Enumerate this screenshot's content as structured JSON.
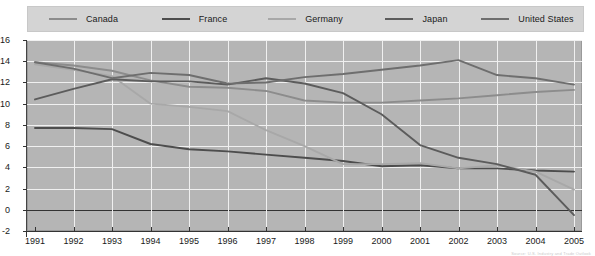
{
  "chart_data": {
    "type": "line",
    "title": "",
    "xlabel": "",
    "ylabel": "",
    "x": [
      1991,
      1992,
      1993,
      1994,
      1995,
      1996,
      1997,
      1998,
      1999,
      2000,
      2001,
      2002,
      2003,
      2004,
      2005
    ],
    "categories": [
      "1991",
      "1992",
      "1993",
      "1994",
      "1995",
      "1996",
      "1997",
      "1998",
      "1999",
      "2000",
      "2001",
      "2002",
      "2003",
      "2004",
      "2005"
    ],
    "xlim": [
      1991,
      2005
    ],
    "ylim": [
      -2,
      16
    ],
    "yticks": [
      -2,
      0,
      2,
      4,
      6,
      8,
      10,
      12,
      14,
      16
    ],
    "grid": true,
    "legend_position": "top",
    "series": [
      {
        "name": "Canada",
        "color": "#8c8c8c",
        "values": [
          13.9,
          13.6,
          13.1,
          12.2,
          11.6,
          11.5,
          11.2,
          10.3,
          10.1,
          10.1,
          10.3,
          10.5,
          10.8,
          11.1,
          11.3
        ]
      },
      {
        "name": "France",
        "color": "#4d4d4d",
        "values": [
          7.7,
          7.7,
          7.6,
          6.2,
          5.7,
          5.5,
          5.2,
          4.9,
          4.6,
          4.1,
          4.2,
          3.9,
          3.9,
          3.7,
          3.6
        ]
      },
      {
        "name": "Germany",
        "color": "#a8a8a8",
        "values": [
          13.7,
          13.2,
          12.6,
          10.0,
          9.7,
          9.3,
          7.5,
          6.0,
          4.3,
          4.3,
          4.4,
          3.9,
          4.2,
          3.6,
          1.9
        ]
      },
      {
        "name": "Japan",
        "color": "#5c5c5c",
        "values": [
          10.4,
          11.4,
          12.3,
          12.1,
          12.1,
          11.8,
          12.4,
          11.9,
          11.0,
          9.0,
          6.1,
          4.9,
          4.3,
          3.3,
          -0.5
        ]
      },
      {
        "name": "United States",
        "color": "#6e6e6e",
        "values": [
          13.9,
          13.3,
          12.4,
          12.9,
          12.7,
          11.9,
          12.0,
          12.5,
          12.8,
          13.2,
          13.6,
          14.1,
          12.7,
          12.4,
          11.8
        ]
      }
    ]
  },
  "legend": {
    "items": [
      {
        "label": "Canada"
      },
      {
        "label": "France"
      },
      {
        "label": "Germany"
      },
      {
        "label": "Japan"
      },
      {
        "label": "United States"
      }
    ]
  },
  "footnote": {
    "text": "Source: U.S. Industry and Trade Outlook"
  }
}
